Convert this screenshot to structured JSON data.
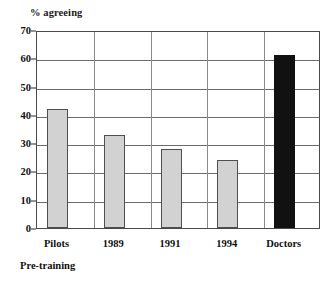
{
  "chart_data": {
    "type": "bar",
    "title": "",
    "ylabel": "% agreeing",
    "xlabel": "",
    "categories": [
      "Pilots",
      "1989",
      "1991",
      "1994",
      "Doctors"
    ],
    "values": [
      42,
      33,
      28,
      24,
      61
    ],
    "ylim": [
      0,
      70
    ],
    "ytick_step": 10,
    "yticks": [
      70,
      60,
      50,
      40,
      30,
      20,
      10,
      0
    ],
    "grid": "horizontal-and-vertical",
    "legend": "none",
    "annotations": [
      "Pre-training"
    ],
    "series": [
      {
        "name": "% agreeing",
        "values": [
          42,
          33,
          28,
          24,
          61
        ]
      }
    ],
    "bar_colors": [
      "#d2d2d2",
      "#d2d2d2",
      "#d2d2d2",
      "#d2d2d2",
      "#111111"
    ],
    "colors": {
      "bar_light_fill": "#d2d2d2",
      "bar_light_stroke": "#4f4f4f",
      "bar_dark_fill": "#111111",
      "gridline": "#6b6b6b",
      "frame": "#4a4a4a",
      "text": "#111111",
      "background": "#ffffff"
    }
  },
  "annotations": {
    "pre_training": "Pre-training"
  }
}
